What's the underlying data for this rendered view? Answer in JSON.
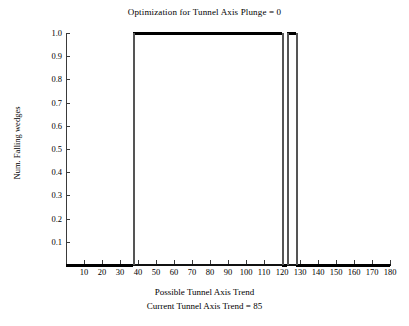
{
  "chart_data": {
    "type": "line",
    "title": "Optimization for Tunnel Axis Plunge = 0",
    "xlabel": "Possible Tunnel Axis Trend",
    "ylabel": "Num. Falling wedges",
    "subcaption": "Current Tunnel Axis Trend = 85",
    "xlim": [
      0,
      180
    ],
    "ylim": [
      0,
      1.0
    ],
    "grid": false,
    "legend": "none",
    "xticks": [
      0,
      10,
      20,
      30,
      40,
      50,
      60,
      70,
      80,
      90,
      100,
      110,
      120,
      130,
      140,
      150,
      160,
      170,
      180
    ],
    "xtick_labels": [
      "",
      "10",
      "20",
      "30",
      "40",
      "50",
      "60",
      "70",
      "80",
      "90",
      "100",
      "110",
      "120",
      "130",
      "140",
      "150",
      "160",
      "170",
      "180"
    ],
    "yticks": [
      0.1,
      0.2,
      0.3,
      0.4,
      0.5,
      0.6,
      0.7,
      0.8,
      0.9,
      1.0
    ],
    "ytick_labels": [
      "0.1",
      "0.2",
      "0.3",
      "0.4",
      "0.5",
      "0.6",
      "0.7",
      "0.8",
      "0.9",
      "1.0"
    ],
    "series": [
      {
        "name": "Num. Falling wedges",
        "x": [
          0,
          37,
          37,
          120,
          120,
          123,
          123,
          128,
          128,
          180
        ],
        "y": [
          0,
          0,
          1.0,
          1.0,
          0,
          0,
          1.0,
          1.0,
          0,
          0
        ]
      }
    ],
    "plateaus": [
      {
        "x_start": 37,
        "x_end": 120,
        "value": 1.0
      },
      {
        "x_start": 123,
        "x_end": 128,
        "value": 1.0
      }
    ],
    "zero_runs": [
      {
        "x_start": 0,
        "x_end": 37,
        "value": 0
      },
      {
        "x_start": 120,
        "x_end": 123,
        "value": 0
      },
      {
        "x_start": 128,
        "x_end": 180,
        "value": 0
      }
    ],
    "transitions": [
      37,
      120,
      123,
      128
    ]
  }
}
